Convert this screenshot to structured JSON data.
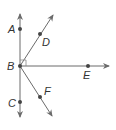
{
  "diagram": {
    "type": "geometry-rays",
    "colors": {
      "line": "#6b6b6b",
      "point": "#444444",
      "label": "#333333"
    },
    "vertex": {
      "label": "B"
    },
    "points": [
      {
        "label": "A",
        "x": 20,
        "y": 29
      },
      {
        "label": "B",
        "x": 20,
        "y": 66
      },
      {
        "label": "C",
        "x": 20,
        "y": 102
      },
      {
        "label": "D",
        "x": 40,
        "y": 34
      },
      {
        "label": "E",
        "x": 88,
        "y": 66
      },
      {
        "label": "F",
        "x": 40,
        "y": 97
      }
    ],
    "rays": [
      {
        "name": "BA",
        "from": "B",
        "through": "A"
      },
      {
        "name": "BC",
        "from": "B",
        "through": "C"
      },
      {
        "name": "BD",
        "from": "B",
        "through": "D"
      },
      {
        "name": "BE",
        "from": "B",
        "through": "E"
      },
      {
        "name": "BF",
        "from": "B",
        "through": "F"
      }
    ],
    "right_angle_marker": {
      "at": "B",
      "between": [
        "BA",
        "BE"
      ]
    },
    "labels": {
      "A": "A",
      "B": "B",
      "C": "C",
      "D": "D",
      "E": "E",
      "F": "F"
    }
  }
}
